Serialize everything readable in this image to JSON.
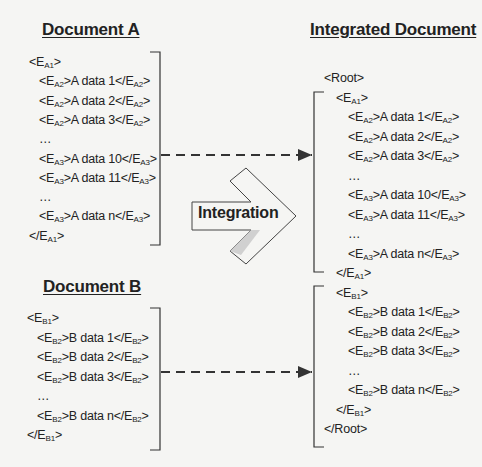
{
  "document_a": {
    "title": "Document A",
    "lines": [
      {
        "indent": 0,
        "pre": "<E",
        "sub": "A1",
        "post": ">"
      },
      {
        "indent": 1,
        "pre": "<E",
        "sub": "A2",
        "mid": ">A data 1</E",
        "sub2": "A2",
        "post": ">"
      },
      {
        "indent": 1,
        "pre": "<E",
        "sub": "A2",
        "mid": ">A data 2</E",
        "sub2": "A2",
        "post": ">"
      },
      {
        "indent": 1,
        "pre": "<E",
        "sub": "A2",
        "mid": ">A data 3</E",
        "sub2": "A2",
        "post": ">"
      },
      {
        "indent": 1,
        "pre": "…"
      },
      {
        "indent": 1,
        "pre": "<E",
        "sub": "A3",
        "mid": ">A data 10</E",
        "sub2": "A3",
        "post": ">"
      },
      {
        "indent": 1,
        "pre": "<E",
        "sub": "A3",
        "mid": ">A data 11</E",
        "sub2": "A3",
        "post": ">"
      },
      {
        "indent": 1,
        "pre": "…"
      },
      {
        "indent": 1,
        "pre": "<E",
        "sub": "A3",
        "mid": ">A data n</E",
        "sub2": "A3",
        "post": ">"
      },
      {
        "indent": 0,
        "pre": "</E",
        "sub": "A1",
        "post": ">"
      }
    ]
  },
  "document_b": {
    "title": "Document B",
    "lines": [
      {
        "indent": 0,
        "pre": "<E",
        "sub": "B1",
        "post": ">"
      },
      {
        "indent": 1,
        "pre": "<E",
        "sub": "B2",
        "mid": ">B data 1</E",
        "sub2": "B2",
        "post": ">"
      },
      {
        "indent": 1,
        "pre": "<E",
        "sub": "B2",
        "mid": ">B data 2</E",
        "sub2": "B2",
        "post": ">"
      },
      {
        "indent": 1,
        "pre": "<E",
        "sub": "B2",
        "mid": ">B data 3</E",
        "sub2": "B2",
        "post": ">"
      },
      {
        "indent": 1,
        "pre": "…"
      },
      {
        "indent": 1,
        "pre": "<E",
        "sub": "B2",
        "mid": ">B data n</E",
        "sub2": "B2",
        "post": ">"
      },
      {
        "indent": 0,
        "pre": "</E",
        "sub": "B1",
        "post": ">"
      }
    ]
  },
  "integrated": {
    "title": "Integrated Document",
    "lines": [
      {
        "indent": 0,
        "pre": "<Root>"
      },
      {
        "indent": 1,
        "pre": "<E",
        "sub": "A1",
        "post": ">"
      },
      {
        "indent": 2,
        "pre": "<E",
        "sub": "A2",
        "mid": ">A data 1</E",
        "sub2": "A2",
        "post": ">"
      },
      {
        "indent": 2,
        "pre": "<E",
        "sub": "A2",
        "mid": ">A data 2</E",
        "sub2": "A2",
        "post": ">"
      },
      {
        "indent": 2,
        "pre": "<E",
        "sub": "A2",
        "mid": ">A data 3</E",
        "sub2": "A2",
        "post": ">"
      },
      {
        "indent": 2,
        "pre": "…"
      },
      {
        "indent": 2,
        "pre": "<E",
        "sub": "A3",
        "mid": ">A data 10</E",
        "sub2": "A3",
        "post": ">"
      },
      {
        "indent": 2,
        "pre": "<E",
        "sub": "A3",
        "mid": ">A data 11</E",
        "sub2": "A3",
        "post": ">"
      },
      {
        "indent": 2,
        "pre": "…"
      },
      {
        "indent": 2,
        "pre": "<E",
        "sub": "A3",
        "mid": ">A data n</E",
        "sub2": "A3",
        "post": ">"
      },
      {
        "indent": 1,
        "pre": "</E",
        "sub": "A1",
        "post": ">"
      },
      {
        "indent": 1,
        "pre": "<E",
        "sub": "B1",
        "post": ">"
      },
      {
        "indent": 2,
        "pre": "<E",
        "sub": "B2",
        "mid": ">B data 1</E",
        "sub2": "B2",
        "post": ">"
      },
      {
        "indent": 2,
        "pre": "<E",
        "sub": "B2",
        "mid": ">B data 2</E",
        "sub2": "B2",
        "post": ">"
      },
      {
        "indent": 2,
        "pre": "<E",
        "sub": "B2",
        "mid": ">B data 3</E",
        "sub2": "B2",
        "post": ">"
      },
      {
        "indent": 2,
        "pre": "…"
      },
      {
        "indent": 2,
        "pre": "<E",
        "sub": "B2",
        "mid": ">B data n</E",
        "sub2": "B2",
        "post": ">"
      },
      {
        "indent": 1,
        "pre": "</E",
        "sub": "B1",
        "post": ">"
      },
      {
        "indent": 0,
        "pre": "</Root>"
      }
    ]
  },
  "integration_arrow": {
    "label": "Integration"
  },
  "colors": {
    "line": "#333333",
    "arrow_fill": "#d0d0d0",
    "background": "#f5f5f3"
  }
}
